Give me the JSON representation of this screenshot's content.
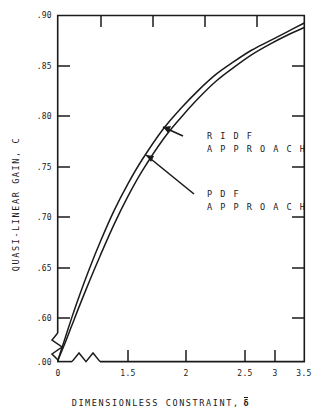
{
  "chart_data": {
    "type": "line",
    "title": "",
    "xlabel": "DIMENSIONLESS CONSTRAINT, δ̅",
    "ylabel": "QUASI-LINEAR GAIN, C",
    "xlim": [
      0,
      3.5
    ],
    "ylim": [
      0.595,
      0.9
    ],
    "grid": false,
    "legend_position": "inline-annotations",
    "axis_break": {
      "x_axis": "zigzag break between 0 and 1.5",
      "y_axis": "zigzag break between .00 and .60"
    },
    "xticks": [
      0,
      1.5,
      2,
      2.5,
      3,
      3.5
    ],
    "xtick_labels": [
      "0",
      "1.5",
      "2",
      "2.5",
      "3",
      "3.5"
    ],
    "yticks": [
      0.0,
      0.6,
      0.65,
      0.7,
      0.75,
      0.8,
      0.85,
      0.9
    ],
    "ytick_labels": [
      ".00",
      ".60",
      ".65",
      ".70",
      ".75",
      ".80",
      ".85",
      ".90"
    ],
    "series": [
      {
        "name": "RIDF APPROACH",
        "x": [
          0.0,
          0.1,
          0.2,
          0.3,
          0.45,
          0.6,
          0.8,
          1.0,
          1.2,
          1.5,
          1.75,
          2.0,
          2.25,
          2.5,
          2.75,
          3.0,
          3.25,
          3.5
        ],
        "values": [
          0.596,
          0.615,
          0.634,
          0.652,
          0.677,
          0.7,
          0.728,
          0.752,
          0.773,
          0.8,
          0.818,
          0.834,
          0.848,
          0.859,
          0.869,
          0.877,
          0.885,
          0.893
        ]
      },
      {
        "name": "PDF APPROACH",
        "x": [
          0.0,
          0.1,
          0.2,
          0.3,
          0.45,
          0.6,
          0.8,
          1.0,
          1.2,
          1.5,
          1.75,
          2.0,
          2.25,
          2.5,
          2.75,
          3.0,
          3.25,
          3.5
        ],
        "values": [
          0.596,
          0.611,
          0.627,
          0.643,
          0.666,
          0.688,
          0.716,
          0.741,
          0.763,
          0.791,
          0.81,
          0.827,
          0.842,
          0.854,
          0.865,
          0.874,
          0.882,
          0.889
        ]
      }
    ],
    "annotations": [
      {
        "name": "RIDF APPROACH",
        "lines": [
          "R I D F",
          "A P P R O A C H"
        ],
        "points_to_series": "RIDF APPROACH"
      },
      {
        "name": "PDF APPROACH",
        "lines": [
          "P D F",
          "A P P R O A C H"
        ],
        "points_to_series": "PDF APPROACH"
      }
    ],
    "colors": {
      "line": "#1a1a1a",
      "axis": "#1a1a1a",
      "background": "#ffffff"
    }
  },
  "labels": {
    "xlabel": "DIMENSIONLESS CONSTRAINT,",
    "xlabel_symbol": "δ",
    "ylabel": "QUASI-LINEAR GAIN, C",
    "ytick_0": ".90",
    "ytick_1": ".85",
    "ytick_2": ".80",
    "ytick_3": ".75",
    "ytick_4": ".70",
    "ytick_5": ".65",
    "ytick_6": ".60",
    "ytick_7": ".00",
    "xtick_0": "0",
    "xtick_1": "1.5",
    "xtick_2": "2",
    "xtick_3": "2.5",
    "xtick_4": "3",
    "xtick_5": "3.5",
    "anno_ridf_1": "R I D F",
    "anno_ridf_2": "A P P R O A C H",
    "anno_pdf_1": "P D F",
    "anno_pdf_2": "A P P R O A C H"
  }
}
